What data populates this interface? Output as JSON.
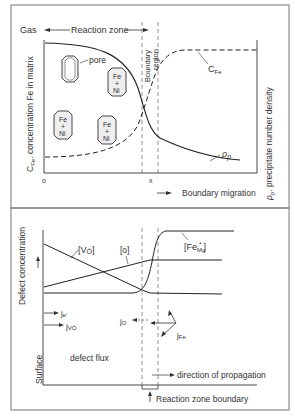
{
  "top_panel": {
    "gas_label": "Gas",
    "reaction_zone_label": "Reaction zone",
    "boundary_label_1": "Boundary",
    "boundary_label_2": "region",
    "pore_label": "pore",
    "particle_top": "Fe",
    "particle_plus": "+",
    "particle_bottom": "Ni",
    "cfe_curve_label": "C",
    "cfe_curve_sub": "Fe",
    "rho_curve_label": "ρ",
    "rho_curve_sub": "p",
    "y_left_label": "C",
    "y_left_sub": "Fe",
    "y_left_rest": ". concentration Fe in matrix",
    "y_right_label": "ρ",
    "y_right_sub": "p",
    "y_right_rest": ". precipitate number density",
    "x_origin": "o",
    "x_mark": "x",
    "x_axis_label": "Boundary migration"
  },
  "bottom_panel": {
    "y_label": "Defect concentration",
    "vo_label": "[V",
    "vo_sub": "Ö",
    "vo_end": "]",
    "o_label": "[o]",
    "fe_label": "[Fe",
    "fe_sub": "Mg",
    "fe_sup": "•",
    "fe_end": "]",
    "je_label": "j",
    "je_sub": "e'",
    "jvo_label": "j",
    "jvo_sub": "VÖ",
    "jo_label": "j",
    "jo_sub": "O",
    "jfe_label": "j",
    "jfe_sub": "Fe",
    "defect_flux_label": "defect flux",
    "surface_label": "Surface",
    "propagation_label": "direction of propagation",
    "boundary_label": "Reaction zone boundary"
  }
}
